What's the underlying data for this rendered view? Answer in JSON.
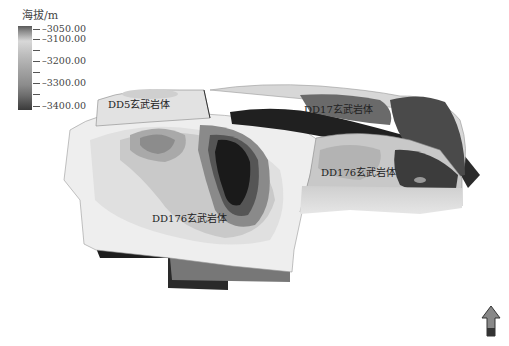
{
  "legend": {
    "title": "海拔/m",
    "ticks": [
      {
        "label": "3050.00",
        "pos": 3
      },
      {
        "label": "3100.00",
        "pos": 13
      },
      {
        "label": "",
        "pos": 24
      },
      {
        "label": "3200.00",
        "pos": 35
      },
      {
        "label": "",
        "pos": 46
      },
      {
        "label": "3300.00",
        "pos": 57
      },
      {
        "label": "",
        "pos": 68
      },
      {
        "label": "3400.00",
        "pos": 80
      }
    ],
    "tick_prefix": "–",
    "colors": {
      "high": "#5a5a5a",
      "mid": "#d8d8d8",
      "low": "#3a3a3a"
    }
  },
  "labels": {
    "dd5": "DD5玄武岩体",
    "dd17": "DD17玄武岩体",
    "dd176_right": "DD176玄武岩体",
    "dd176_left": "DD176玄武岩体"
  },
  "north_arrow": {
    "icon": "north-arrow-icon"
  }
}
